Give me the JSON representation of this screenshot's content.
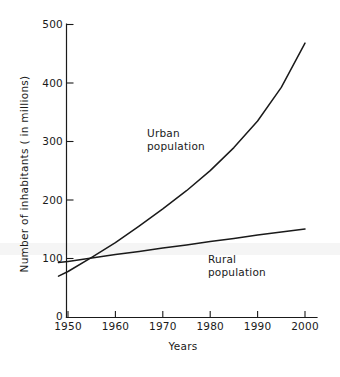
{
  "chart_data": {
    "type": "line",
    "title": "",
    "subtitle": "",
    "xlabel": "Years",
    "ylabel": "Number of inhabitants ( in millions)",
    "xlim": [
      1948,
      2002
    ],
    "ylim": [
      0,
      500
    ],
    "xticks": [
      "1950",
      "1960",
      "1970",
      "1980",
      "1990",
      "2000"
    ],
    "xtick_values": [
      1950,
      1960,
      1970,
      1980,
      1990,
      2000
    ],
    "yticks": [
      "0",
      "100",
      "200",
      "300",
      "400",
      "500"
    ],
    "ytick_values": [
      0,
      100,
      200,
      300,
      400,
      500
    ],
    "grid": false,
    "legend_position": "inline-annotations",
    "x": [
      1948,
      1950,
      1955,
      1960,
      1965,
      1970,
      1975,
      1980,
      1985,
      1990,
      1995,
      2000
    ],
    "series": [
      {
        "name": "Urban population",
        "values": [
          70,
          78,
          102,
          127,
          155,
          184,
          215,
          249,
          288,
          333,
          390,
          465
        ],
        "color": "#1a1a1a",
        "annotation": {
          "line1": "Urban",
          "line2": "population"
        }
      },
      {
        "name": "Rural population",
        "values": [
          93,
          95,
          101,
          107,
          112,
          118,
          123,
          129,
          134,
          140,
          145,
          150
        ],
        "color": "#1a1a1a",
        "annotation": {
          "line1": "Rural",
          "line2": "population"
        }
      }
    ],
    "annotations": [
      {
        "text": "Urban population",
        "x": 1972,
        "y": 300
      },
      {
        "text": "Rural population",
        "x": 1983,
        "y": 118
      }
    ]
  },
  "axes": {
    "y_title": "Number of inhabitants ( in millions)",
    "x_title": "Years",
    "y_tick_labels": {
      "t0": "0",
      "t100": "100",
      "t200": "200",
      "t300": "300",
      "t400": "400",
      "t500": "500"
    },
    "x_tick_labels": {
      "t1950": "1950",
      "t1960": "1960",
      "t1970": "1970",
      "t1980": "1980",
      "t1990": "1990",
      "t2000": "2000"
    }
  },
  "labels": {
    "urban_line1": "Urban",
    "urban_line2": "population",
    "rural_line1": "Rural",
    "rural_line2": "population"
  },
  "colors": {
    "ink": "#1a1a1a",
    "background": "#ffffff",
    "band": "#f2f2f2"
  }
}
